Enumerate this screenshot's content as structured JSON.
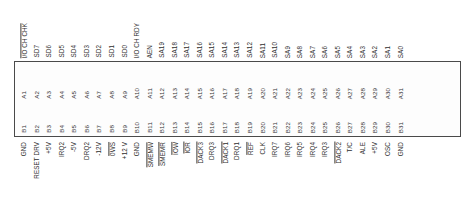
{
  "diagram": {
    "colors": {
      "background": "#ffffff",
      "box_border": "#4a4a4a",
      "text": "#2e2e2e"
    },
    "top_signals": [
      {
        "label": "I/O CH CHK",
        "overline": true
      },
      {
        "label": "SD7",
        "overline": false
      },
      {
        "label": "SD6",
        "overline": false
      },
      {
        "label": "SD5",
        "overline": false
      },
      {
        "label": "SD4",
        "overline": false
      },
      {
        "label": "SD3",
        "overline": false
      },
      {
        "label": "SD2",
        "overline": false
      },
      {
        "label": "SD1",
        "overline": false
      },
      {
        "label": "SD0",
        "overline": false
      },
      {
        "label": "I/O CH RDY",
        "overline": false
      },
      {
        "label": "AEN",
        "overline": false
      },
      {
        "label": "SA19",
        "overline": false
      },
      {
        "label": "SA18",
        "overline": false
      },
      {
        "label": "SA17",
        "overline": false
      },
      {
        "label": "SA16",
        "overline": false
      },
      {
        "label": "SA15",
        "overline": false
      },
      {
        "label": "SA14",
        "overline": false
      },
      {
        "label": "SA13",
        "overline": false
      },
      {
        "label": "SA12",
        "overline": false
      },
      {
        "label": "SA11",
        "overline": false
      },
      {
        "label": "SA10",
        "overline": false
      },
      {
        "label": "SA9",
        "overline": false
      },
      {
        "label": "SA8",
        "overline": false
      },
      {
        "label": "SA7",
        "overline": false
      },
      {
        "label": "SA6",
        "overline": false
      },
      {
        "label": "SA5",
        "overline": false
      },
      {
        "label": "SA4",
        "overline": false
      },
      {
        "label": "SA3",
        "overline": false
      },
      {
        "label": "SA2",
        "overline": false
      },
      {
        "label": "SA1",
        "overline": false
      },
      {
        "label": "SA0",
        "overline": false
      }
    ],
    "row_a_pins": [
      "A1",
      "A2",
      "A3",
      "A4",
      "A5",
      "A6",
      "A7",
      "A8",
      "A9",
      "A10",
      "A11",
      "A12",
      "A13",
      "A14",
      "A15",
      "A16",
      "A17",
      "A18",
      "A19",
      "A20",
      "A21",
      "A22",
      "A23",
      "A24",
      "A25",
      "A26",
      "A27",
      "A28",
      "A29",
      "A30",
      "A31"
    ],
    "row_b_pins": [
      "B1",
      "B2",
      "B3",
      "B4",
      "B5",
      "B6",
      "B7",
      "B8",
      "B9",
      "B10",
      "B11",
      "B12",
      "B13",
      "B14",
      "B15",
      "B16",
      "B17",
      "B18",
      "B19",
      "B20",
      "B21",
      "B22",
      "B23",
      "B24",
      "B25",
      "B26",
      "B27",
      "B28",
      "B29",
      "B30",
      "B31"
    ],
    "bottom_signals": [
      {
        "label": "GND",
        "overline": false
      },
      {
        "label": "RESET DRV",
        "overline": false
      },
      {
        "label": "+5V",
        "overline": false
      },
      {
        "label": "IRQ2",
        "overline": false
      },
      {
        "label": "-5V",
        "overline": false
      },
      {
        "label": "DRQ2",
        "overline": false
      },
      {
        "label": "-12V",
        "overline": false
      },
      {
        "label": "0WS",
        "overline": true
      },
      {
        "label": "+12 V",
        "overline": false
      },
      {
        "label": "GND",
        "overline": false
      },
      {
        "label": "SMEMW",
        "overline": true
      },
      {
        "label": "SMEMR",
        "overline": true
      },
      {
        "label": "IOW",
        "overline": true
      },
      {
        "label": "IOR",
        "overline": true
      },
      {
        "label": "DACK3",
        "overline": true
      },
      {
        "label": "DRQ3",
        "overline": false
      },
      {
        "label": "DACK1",
        "overline": true
      },
      {
        "label": "DRQ1",
        "overline": false
      },
      {
        "label": "REF",
        "overline": true
      },
      {
        "label": "CLK",
        "overline": false
      },
      {
        "label": "IRQ7",
        "overline": false
      },
      {
        "label": "IRQ6",
        "overline": false
      },
      {
        "label": "IRQ5",
        "overline": false
      },
      {
        "label": "IRQ4",
        "overline": false
      },
      {
        "label": "IRQ3",
        "overline": false
      },
      {
        "label": "DACK2",
        "overline": true
      },
      {
        "label": "T/C",
        "overline": false
      },
      {
        "label": "ALE",
        "overline": false
      },
      {
        "label": "+5V",
        "overline": false
      },
      {
        "label": "OSC",
        "overline": false
      },
      {
        "label": "GND",
        "overline": false
      }
    ]
  }
}
